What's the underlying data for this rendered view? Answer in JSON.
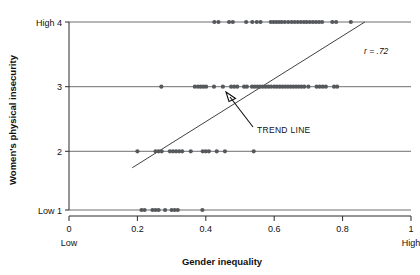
{
  "chart_data": {
    "type": "scatter",
    "title": "",
    "xlabel": "Gender inequality",
    "ylabel": "Women's physical insecurity",
    "xlim": [
      0,
      1
    ],
    "ylim": [
      1,
      4
    ],
    "grid": "horizontal-category-lines",
    "legend": "none",
    "x_ticks": [
      "0",
      "0.2",
      "0.4",
      "0.6",
      "0.8",
      "1"
    ],
    "x_tick_values": [
      0,
      0.2,
      0.4,
      0.6,
      0.8,
      1
    ],
    "x_low_label": "Low",
    "x_high_label": "High",
    "y_ticks": [
      "Low 1",
      "2",
      "3",
      "High 4"
    ],
    "y_tick_values": [
      1,
      2,
      3,
      4
    ],
    "y_low_label": "Low",
    "y_high_label": "High",
    "annotations": [
      {
        "name": "correlation",
        "text": "r = .72"
      },
      {
        "name": "trend-line-callout",
        "text": "TREND LINE"
      }
    ],
    "trend_line": {
      "x_start": 0.185,
      "y_start": 1.72,
      "x_end": 0.865,
      "y_end": 4.0
    },
    "points": [
      {
        "x": 0.425,
        "y": 4
      },
      {
        "x": 0.437,
        "y": 4
      },
      {
        "x": 0.468,
        "y": 4
      },
      {
        "x": 0.479,
        "y": 4
      },
      {
        "x": 0.518,
        "y": 4
      },
      {
        "x": 0.536,
        "y": 4
      },
      {
        "x": 0.549,
        "y": 4
      },
      {
        "x": 0.56,
        "y": 4
      },
      {
        "x": 0.59,
        "y": 4
      },
      {
        "x": 0.598,
        "y": 4
      },
      {
        "x": 0.606,
        "y": 4
      },
      {
        "x": 0.614,
        "y": 4
      },
      {
        "x": 0.622,
        "y": 4
      },
      {
        "x": 0.631,
        "y": 4
      },
      {
        "x": 0.641,
        "y": 4
      },
      {
        "x": 0.651,
        "y": 4
      },
      {
        "x": 0.66,
        "y": 4
      },
      {
        "x": 0.669,
        "y": 4
      },
      {
        "x": 0.678,
        "y": 4
      },
      {
        "x": 0.687,
        "y": 4
      },
      {
        "x": 0.695,
        "y": 4
      },
      {
        "x": 0.704,
        "y": 4
      },
      {
        "x": 0.713,
        "y": 4
      },
      {
        "x": 0.722,
        "y": 4
      },
      {
        "x": 0.731,
        "y": 4
      },
      {
        "x": 0.74,
        "y": 4
      },
      {
        "x": 0.77,
        "y": 4
      },
      {
        "x": 0.781,
        "y": 4
      },
      {
        "x": 0.824,
        "y": 4
      },
      {
        "x": 0.27,
        "y": 3
      },
      {
        "x": 0.368,
        "y": 3
      },
      {
        "x": 0.377,
        "y": 3
      },
      {
        "x": 0.385,
        "y": 3
      },
      {
        "x": 0.393,
        "y": 3
      },
      {
        "x": 0.401,
        "y": 3
      },
      {
        "x": 0.424,
        "y": 3
      },
      {
        "x": 0.45,
        "y": 3
      },
      {
        "x": 0.474,
        "y": 3
      },
      {
        "x": 0.483,
        "y": 3
      },
      {
        "x": 0.492,
        "y": 3
      },
      {
        "x": 0.512,
        "y": 3
      },
      {
        "x": 0.52,
        "y": 3
      },
      {
        "x": 0.535,
        "y": 3
      },
      {
        "x": 0.543,
        "y": 3
      },
      {
        "x": 0.551,
        "y": 3
      },
      {
        "x": 0.559,
        "y": 3
      },
      {
        "x": 0.567,
        "y": 3
      },
      {
        "x": 0.575,
        "y": 3
      },
      {
        "x": 0.583,
        "y": 3
      },
      {
        "x": 0.591,
        "y": 3
      },
      {
        "x": 0.6,
        "y": 3
      },
      {
        "x": 0.608,
        "y": 3
      },
      {
        "x": 0.616,
        "y": 3
      },
      {
        "x": 0.624,
        "y": 3
      },
      {
        "x": 0.632,
        "y": 3
      },
      {
        "x": 0.64,
        "y": 3
      },
      {
        "x": 0.648,
        "y": 3
      },
      {
        "x": 0.656,
        "y": 3
      },
      {
        "x": 0.664,
        "y": 3
      },
      {
        "x": 0.672,
        "y": 3
      },
      {
        "x": 0.68,
        "y": 3
      },
      {
        "x": 0.688,
        "y": 3
      },
      {
        "x": 0.7,
        "y": 3
      },
      {
        "x": 0.724,
        "y": 3
      },
      {
        "x": 0.733,
        "y": 3
      },
      {
        "x": 0.742,
        "y": 3
      },
      {
        "x": 0.751,
        "y": 3
      },
      {
        "x": 0.775,
        "y": 3
      },
      {
        "x": 0.784,
        "y": 3
      },
      {
        "x": 0.2,
        "y": 2
      },
      {
        "x": 0.253,
        "y": 2
      },
      {
        "x": 0.262,
        "y": 2
      },
      {
        "x": 0.271,
        "y": 2
      },
      {
        "x": 0.295,
        "y": 2
      },
      {
        "x": 0.304,
        "y": 2
      },
      {
        "x": 0.313,
        "y": 2
      },
      {
        "x": 0.322,
        "y": 2
      },
      {
        "x": 0.331,
        "y": 2
      },
      {
        "x": 0.356,
        "y": 2
      },
      {
        "x": 0.391,
        "y": 2
      },
      {
        "x": 0.4,
        "y": 2
      },
      {
        "x": 0.409,
        "y": 2
      },
      {
        "x": 0.432,
        "y": 2
      },
      {
        "x": 0.456,
        "y": 2
      },
      {
        "x": 0.54,
        "y": 2
      },
      {
        "x": 0.212,
        "y": 1
      },
      {
        "x": 0.221,
        "y": 1
      },
      {
        "x": 0.244,
        "y": 1
      },
      {
        "x": 0.253,
        "y": 1
      },
      {
        "x": 0.262,
        "y": 1
      },
      {
        "x": 0.281,
        "y": 1
      },
      {
        "x": 0.3,
        "y": 1
      },
      {
        "x": 0.309,
        "y": 1
      },
      {
        "x": 0.318,
        "y": 1
      },
      {
        "x": 0.39,
        "y": 1
      }
    ]
  }
}
